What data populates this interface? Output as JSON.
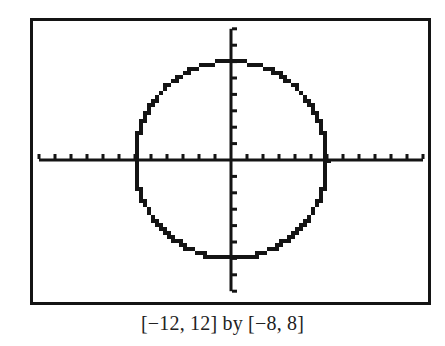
{
  "caption": "[−12, 12] by [−8, 8]",
  "chart_data": {
    "type": "line",
    "title": "",
    "caption": "[−12, 12] by [−8, 8]",
    "xlabel": "",
    "ylabel": "",
    "xlim": [
      -12,
      12
    ],
    "ylim": [
      -8,
      8
    ],
    "xscl": 1,
    "yscl": 1,
    "grid": false,
    "axes": true,
    "legend": null,
    "series": [
      {
        "name": "circle",
        "shape": "circle",
        "center": [
          0,
          0
        ],
        "radius": 6,
        "radius_source": "estimated from pixel extent; no equation is shown in the image",
        "style": "pixelated calculator plot"
      }
    ]
  },
  "colors": {
    "ink": "#141414",
    "background": "#ffffff"
  }
}
